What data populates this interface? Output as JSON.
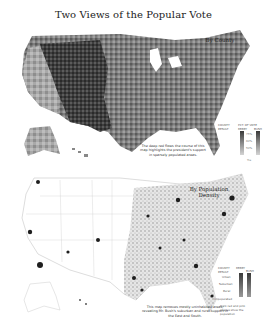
{
  "title": "Two Views of the Popular Vote",
  "maps": [
    {
      "label": "By County",
      "note": "The deep red flows the course of this map highlights the president's support in sparsely populated areas.",
      "legend": {
        "heading_left": "COUNTY RESULT",
        "heading_right": "PCT. OF VOTE",
        "col_a": "KERRY",
        "col_b": "BUSH",
        "ticks": [
          "75%",
          "60%",
          "50%",
          "Tie"
        ],
        "colors": {
          "dark": "#3a3a3a",
          "mid": "#8a8a8a",
          "light": "#d4d4d4"
        }
      }
    },
    {
      "label": "By Population Density",
      "note": "This map removes mostly uninhabited areas, revealing Mr. Bush's suburban and rural support in the East and South.",
      "legend": {
        "heading_left": "COUNTY RESULT",
        "col_a": "KERRY",
        "col_b": "BUSH",
        "rows": [
          "Urban",
          "Suburban",
          "Rural",
          "Unpopulated"
        ],
        "footnote": "Dark red and pink shades show the population"
      }
    }
  ]
}
